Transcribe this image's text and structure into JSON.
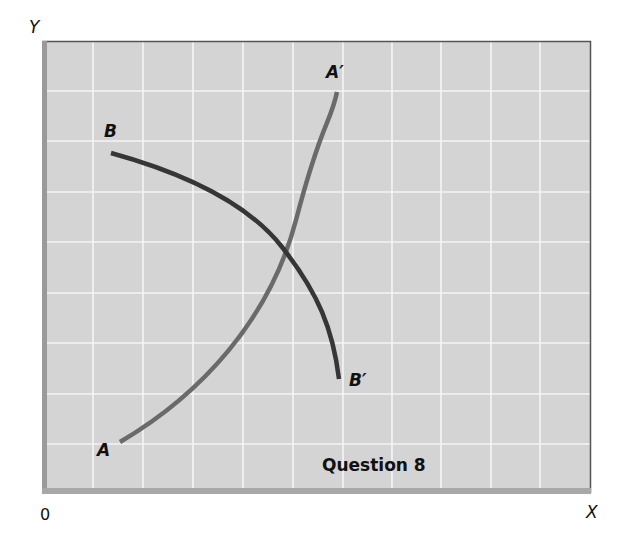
{
  "figure": {
    "caption": "Question 8",
    "axes": {
      "y_label": "Y",
      "x_label": "X",
      "origin_label": "0"
    },
    "colors": {
      "plot_background": "#d4d4d4",
      "grid_line": "#f5f5f5",
      "curve_aa": "#6a6a6a",
      "curve_bb": "#363636",
      "left_border": "#9a9a9a",
      "bottom_border": "#a8a8a8",
      "top_right_border": "#555555"
    },
    "grid": {
      "columns": 11,
      "rows": 9
    },
    "curves": [
      {
        "id": "AA",
        "start_label": "A",
        "end_label": "A′",
        "shape": "upward-sloping, convex (steepening)"
      },
      {
        "id": "BB",
        "start_label": "B",
        "end_label": "B′",
        "shape": "downward-sloping, concave (steepening)"
      }
    ]
  }
}
